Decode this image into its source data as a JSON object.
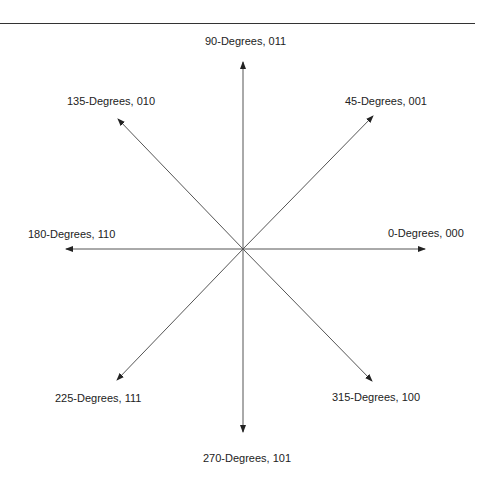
{
  "diagram": {
    "type": "direction-vector-encoding",
    "center": [
      243,
      249
    ],
    "directions": [
      {
        "angle": 0,
        "code": "000",
        "label": "0-Degrees, 000"
      },
      {
        "angle": 45,
        "code": "001",
        "label": "45-Degrees, 001"
      },
      {
        "angle": 90,
        "code": "011",
        "label": "90-Degrees, 011"
      },
      {
        "angle": 135,
        "code": "010",
        "label": "135-Degrees, 010"
      },
      {
        "angle": 180,
        "code": "110",
        "label": "180-Degrees, 110"
      },
      {
        "angle": 225,
        "code": "111",
        "label": "225-Degrees, 111"
      },
      {
        "angle": 270,
        "code": "101",
        "label": "270-Degrees, 101"
      },
      {
        "angle": 315,
        "code": "100",
        "label": "315-Degrees, 100"
      }
    ]
  }
}
